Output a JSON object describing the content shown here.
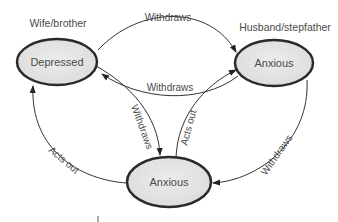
{
  "diagram": {
    "roles": {
      "left": "Wife/brother",
      "right": "Husband/stepfather"
    },
    "nodes": [
      {
        "id": "depressed",
        "label": "Depressed",
        "role": "Wife/brother"
      },
      {
        "id": "anxious-right",
        "label": "Anxious",
        "role": "Husband/stepfather"
      },
      {
        "id": "anxious-bottom",
        "label": "Anxious"
      }
    ],
    "edges": [
      {
        "from": "depressed",
        "to": "anxious-right",
        "label": "Withdraws"
      },
      {
        "from": "anxious-right",
        "to": "depressed",
        "label": "Withdraws"
      },
      {
        "from": "depressed",
        "to": "anxious-bottom",
        "label": "Withdraws"
      },
      {
        "from": "anxious-bottom",
        "to": "anxious-right",
        "label": "Acts out"
      },
      {
        "from": "anxious-bottom",
        "to": "depressed",
        "label": "Acts out"
      },
      {
        "from": "anxious-right",
        "to": "anxious-bottom",
        "label": "Withdraws"
      }
    ],
    "colors": {
      "node_fill": "#e4e4e4",
      "node_stroke": "#2a2a2a",
      "text": "#4a4a4a",
      "line": "#333333"
    }
  }
}
